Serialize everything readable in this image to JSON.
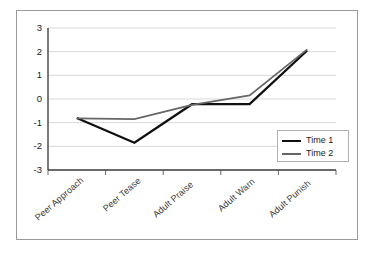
{
  "chart_data": {
    "type": "line",
    "title": "",
    "xlabel": "",
    "ylabel": "",
    "categories": [
      "Peer Approach",
      "Peer Tease",
      "Adult Praise",
      "Adult Warn",
      "Adult Punish"
    ],
    "series": [
      {
        "name": "Time 1",
        "color": "#111111",
        "values": [
          -0.8,
          -1.85,
          -0.22,
          -0.22,
          2.05
        ]
      },
      {
        "name": "Time 2",
        "color": "#666666",
        "values": [
          -0.82,
          -0.85,
          -0.25,
          0.15,
          2.1
        ]
      }
    ],
    "ylim": [
      -3,
      3
    ],
    "y_ticks": [
      3,
      2,
      1,
      0,
      -1,
      -2,
      -3
    ],
    "y_tick_labels": [
      "3",
      "2",
      "1",
      "0",
      "-1",
      "-2",
      "-3"
    ],
    "grid": true,
    "grid_axis": "y",
    "legend_position": "center-right",
    "colors": {
      "grid": "#d9d9d9",
      "axis": "#595959",
      "frame": "#9a9a9a",
      "background": "#ffffff",
      "tick_text": "#1a1a1a",
      "category_text": "#3a3a3a"
    }
  }
}
